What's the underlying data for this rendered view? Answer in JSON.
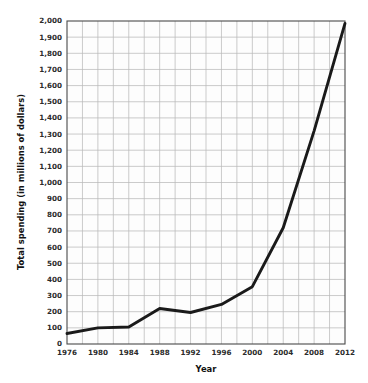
{
  "chart_data": {
    "type": "line",
    "title": "",
    "xlabel": "Year",
    "ylabel": "Total spending (in millions of dollars)",
    "x": [
      1976,
      1980,
      1984,
      1988,
      1992,
      1996,
      2000,
      2004,
      2008,
      2012
    ],
    "values": [
      65,
      100,
      105,
      220,
      195,
      245,
      355,
      720,
      1320,
      1985
    ],
    "series": [
      {
        "name": "Total spending",
        "values": [
          65,
          100,
          105,
          220,
          195,
          245,
          355,
          720,
          1320,
          1985
        ]
      }
    ],
    "xlim": [
      1976,
      2012
    ],
    "ylim": [
      0,
      2000
    ],
    "y_tick_step": 100,
    "x_tick_step": 4,
    "x_gridline_step": 2,
    "xticklabels": [
      "1976",
      "1980",
      "1984",
      "1988",
      "1992",
      "1996",
      "2000",
      "2004",
      "2008",
      "2012"
    ],
    "yticklabels": [
      "0",
      "100",
      "200",
      "300",
      "400",
      "500",
      "600",
      "700",
      "800",
      "900",
      "1,000",
      "1,100",
      "1,200",
      "1,300",
      "1,400",
      "1,500",
      "1,600",
      "1,700",
      "1,800",
      "1,900",
      "2,000"
    ],
    "grid": true,
    "legend": false,
    "legend_position": "none",
    "colors": {
      "line": "#1a1a1a",
      "grid": "#b9b9b9",
      "axis": "#4a4a4a",
      "plot_background": "#fdfdfd",
      "page_background": "#ffffff",
      "text": "#2b2b2b"
    }
  },
  "axis_titles": {
    "x": "Year",
    "y": "Total spending (in millions of dollars)"
  }
}
